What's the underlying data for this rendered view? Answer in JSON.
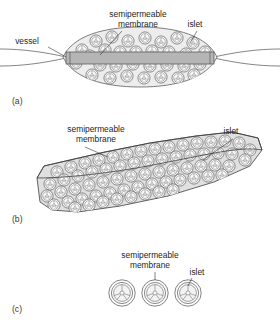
{
  "figure": {
    "background": "#ffffff",
    "ink": "#231f20",
    "fill_chamber": "#e3e3e3",
    "fill_vessel": "#b5b5b5",
    "fill_islet": "#f2f2f2"
  },
  "panels": [
    {
      "id": "a",
      "label": "(a)",
      "type": "intravascular-perfusion-device",
      "labels": [
        {
          "name": "vessel",
          "text": "vessel",
          "x": 27,
          "y": 44
        },
        {
          "name": "semipermeable-membrane",
          "text": "semipermeable",
          "x": 138,
          "y": 17
        },
        {
          "name": "semipermeable-membrane-2",
          "text": "membrane",
          "x": 138,
          "y": 27
        },
        {
          "name": "islet",
          "text": "islet",
          "x": 187,
          "y": 27
        }
      ],
      "islet_count": 28
    },
    {
      "id": "b",
      "label": "(b)",
      "type": "planar-diffusion-chamber",
      "labels": [
        {
          "name": "semipermeable-membrane",
          "text": "semipermeable",
          "x": 96,
          "y": 132
        },
        {
          "name": "semipermeable-membrane-2",
          "text": "membrane",
          "x": 96,
          "y": 142
        },
        {
          "name": "islet",
          "text": "islet",
          "x": 231,
          "y": 134
        }
      ],
      "islet_count": 62
    },
    {
      "id": "c",
      "label": "(c)",
      "type": "microcapsules",
      "labels": [
        {
          "name": "semipermeable-membrane",
          "text": "semipermeable",
          "x": 150,
          "y": 258
        },
        {
          "name": "semipermeable-membrane-2",
          "text": "membrane",
          "x": 150,
          "y": 268
        },
        {
          "name": "islet",
          "text": "islet",
          "x": 190,
          "y": 275
        }
      ],
      "capsule_count": 3
    }
  ]
}
